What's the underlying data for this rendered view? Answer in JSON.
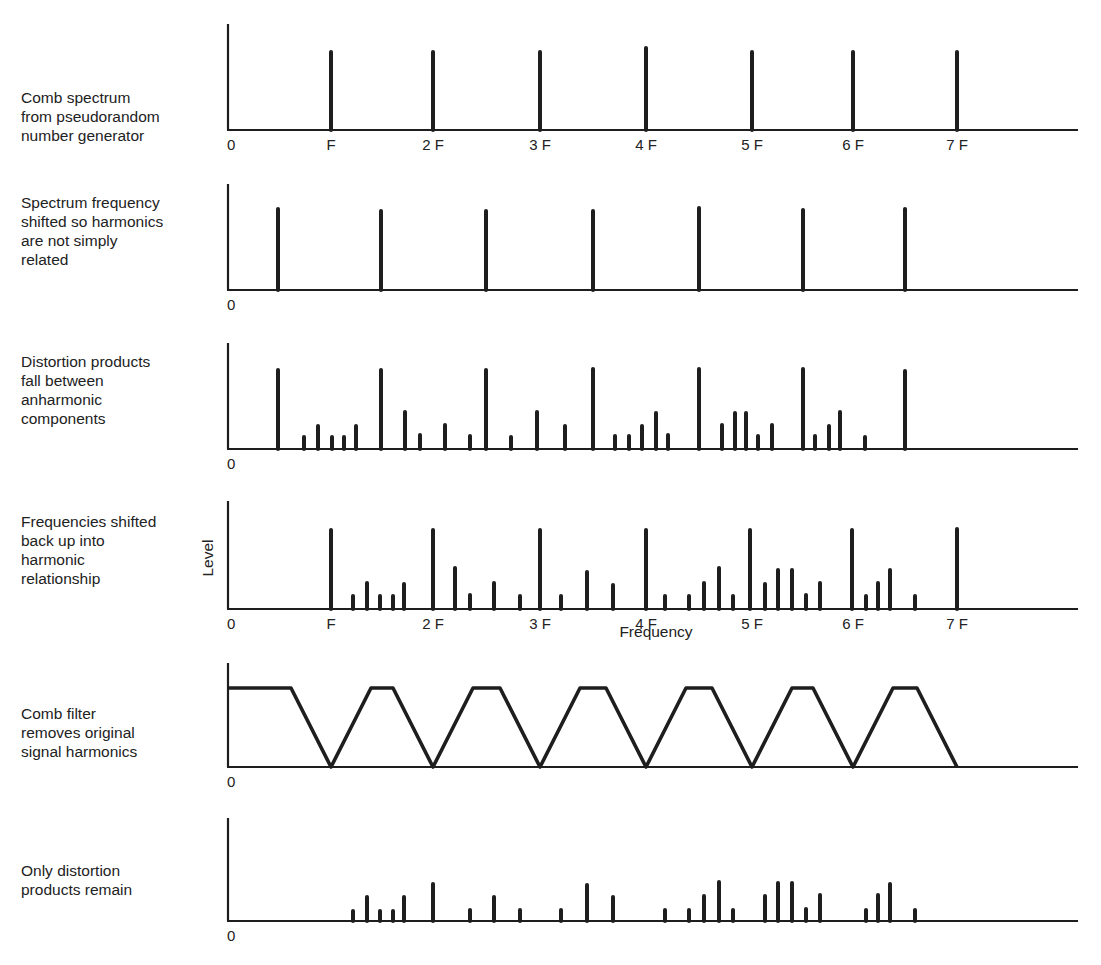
{
  "panels": [
    {
      "label": "Comb spectrum\nfrom pseudorandom\nnumber generator",
      "label_top": 88,
      "axis_top": 24,
      "baseline": 130,
      "tick_labels": [
        "0",
        "F",
        "2 F",
        "3 F",
        "4 F",
        "5 F",
        "6 F",
        "7 F"
      ],
      "bars": [
        [
          331,
          78
        ],
        [
          433,
          78
        ],
        [
          540,
          78
        ],
        [
          646,
          82
        ],
        [
          752,
          78
        ],
        [
          853,
          78
        ],
        [
          957,
          78
        ]
      ]
    },
    {
      "label": "Spectrum frequency\nshifted so harmonics\nare not simply\nrelated",
      "label_top": 193,
      "axis_top": 184,
      "baseline": 290,
      "tick_labels": [
        "0"
      ],
      "bars": [
        [
          278,
          81
        ],
        [
          381,
          79
        ],
        [
          486,
          79
        ],
        [
          593,
          79
        ],
        [
          699,
          82
        ],
        [
          803,
          80
        ],
        [
          905,
          81
        ]
      ]
    },
    {
      "label": "Distortion products\nfall between\nanharmonic\ncomponents",
      "label_top": 352,
      "axis_top": 343,
      "baseline": 449,
      "tick_labels": [
        "0"
      ],
      "bars": [
        [
          278,
          79
        ],
        [
          304,
          12
        ],
        [
          318,
          23
        ],
        [
          332,
          12
        ],
        [
          344,
          12
        ],
        [
          356,
          23
        ],
        [
          381,
          79
        ],
        [
          405,
          37
        ],
        [
          420,
          14
        ],
        [
          445,
          24
        ],
        [
          470,
          13
        ],
        [
          486,
          79
        ],
        [
          511,
          12
        ],
        [
          537,
          37
        ],
        [
          565,
          23
        ],
        [
          593,
          80
        ],
        [
          615,
          13
        ],
        [
          629,
          13
        ],
        [
          642,
          23
        ],
        [
          656,
          36
        ],
        [
          668,
          14
        ],
        [
          699,
          80
        ],
        [
          722,
          24
        ],
        [
          735,
          36
        ],
        [
          746,
          36
        ],
        [
          758,
          13
        ],
        [
          772,
          24
        ],
        [
          803,
          80
        ],
        [
          815,
          13
        ],
        [
          829,
          23
        ],
        [
          840,
          37
        ],
        [
          865,
          12
        ],
        [
          905,
          78
        ]
      ]
    },
    {
      "label": "Frequencies shifted\nback up into\nharmonic\nrelationship",
      "label_top": 512,
      "axis_top": 501,
      "baseline": 609,
      "tick_labels": [
        "0",
        "F",
        "2 F",
        "3 F",
        "4 F",
        "5 F",
        "6 F",
        "7 F"
      ],
      "bars": [
        [
          331,
          79
        ],
        [
          353,
          13
        ],
        [
          367,
          26
        ],
        [
          380,
          13
        ],
        [
          393,
          13
        ],
        [
          404,
          25
        ],
        [
          433,
          79
        ],
        [
          455,
          41
        ],
        [
          470,
          14
        ],
        [
          494,
          26
        ],
        [
          520,
          13
        ],
        [
          540,
          79
        ],
        [
          561,
          13
        ],
        [
          587,
          37
        ],
        [
          613,
          24
        ],
        [
          646,
          79
        ],
        [
          665,
          13
        ],
        [
          689,
          13
        ],
        [
          704,
          26
        ],
        [
          719,
          41
        ],
        [
          733,
          13
        ],
        [
          750,
          79
        ],
        [
          765,
          25
        ],
        [
          778,
          39
        ],
        [
          792,
          39
        ],
        [
          806,
          14
        ],
        [
          820,
          26
        ],
        [
          852,
          79
        ],
        [
          866,
          13
        ],
        [
          878,
          26
        ],
        [
          890,
          39
        ],
        [
          915,
          13
        ],
        [
          957,
          80
        ]
      ]
    },
    {
      "label": "Comb filter\nremoves original\nsignal harmonics",
      "label_top": 704,
      "axis_top": 663,
      "baseline": 767,
      "tick_labels": [
        "0"
      ],
      "filter_notches": [
        331,
        433,
        540,
        646,
        752,
        853,
        957
      ],
      "filter_top": 688
    },
    {
      "label": "Only distortion\nproducts remain",
      "label_top": 861,
      "axis_top": 818,
      "baseline": 921,
      "tick_labels": [
        "0"
      ],
      "bars": [
        [
          353,
          10
        ],
        [
          367,
          24
        ],
        [
          380,
          10
        ],
        [
          393,
          10
        ],
        [
          404,
          24
        ],
        [
          433,
          37
        ],
        [
          470,
          11
        ],
        [
          494,
          24
        ],
        [
          520,
          11
        ],
        [
          561,
          11
        ],
        [
          587,
          36
        ],
        [
          613,
          24
        ],
        [
          665,
          11
        ],
        [
          689,
          11
        ],
        [
          704,
          25
        ],
        [
          719,
          39
        ],
        [
          733,
          11
        ],
        [
          765,
          25
        ],
        [
          778,
          38
        ],
        [
          792,
          38
        ],
        [
          806,
          12
        ],
        [
          820,
          26
        ],
        [
          866,
          11
        ],
        [
          878,
          26
        ],
        [
          890,
          37
        ],
        [
          915,
          11
        ]
      ]
    }
  ],
  "axes": {
    "x_label": "Frequency",
    "y_label": "Level"
  },
  "layout": {
    "axis_left": 228,
    "axis_right": 1078,
    "tick_x": [
      228,
      331,
      433,
      540,
      646,
      752,
      853,
      957
    ],
    "line_color": "#1e1e1e"
  }
}
